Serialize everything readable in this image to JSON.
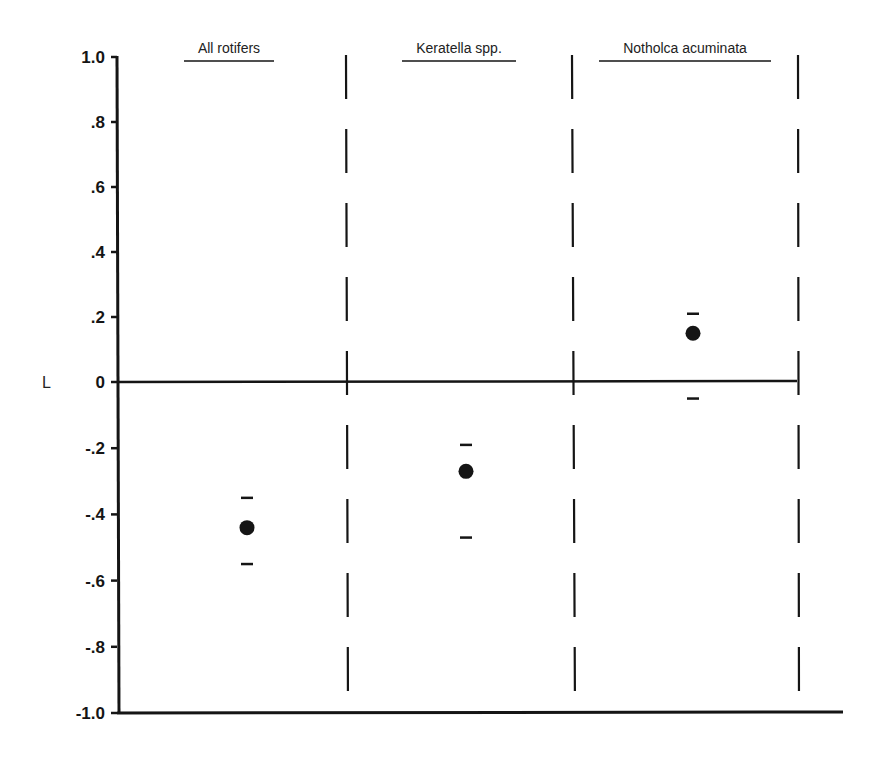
{
  "chart_data": {
    "type": "scatter",
    "title": "",
    "xlabel": "",
    "ylabel": "L",
    "ylim": [
      -1.0,
      1.0
    ],
    "yticks": [
      1.0,
      0.8,
      0.6,
      0.4,
      0.2,
      0,
      -0.2,
      -0.4,
      -0.6,
      -0.8,
      -1.0
    ],
    "ytick_labels": [
      "1.0",
      ".8",
      ".6",
      ".4",
      ".2",
      "0",
      "-.2",
      "-.4",
      "-.6",
      "-.8",
      "-1.0"
    ],
    "grid": false,
    "legend": null,
    "panels": [
      "All rotifers",
      "Keratella spp.",
      "Notholca acuminata"
    ],
    "series": [
      {
        "name": "L (mean with error limits)",
        "categories": [
          "All rotifers",
          "Keratella spp.",
          "Notholca acuminata"
        ],
        "values": [
          -0.44,
          -0.27,
          0.15
        ],
        "upper": [
          -0.35,
          -0.19,
          0.21
        ],
        "lower": [
          -0.55,
          -0.47,
          -0.05
        ]
      }
    ],
    "annotations": [
      "Dashed vertical separators between panels",
      "Horizontal zero line"
    ]
  },
  "colors": {
    "ink": "#151515",
    "background": "#ffffff"
  }
}
